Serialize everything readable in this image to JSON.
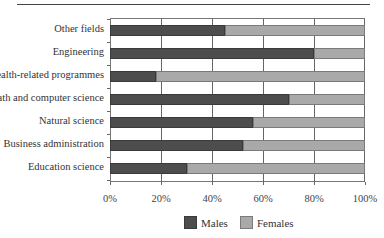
{
  "chart_data": {
    "type": "bar",
    "orientation": "horizontal",
    "stacked": "percent",
    "title": "",
    "xlabel": "",
    "ylabel": "",
    "categories": [
      "Other fields",
      "Engineering",
      "Health-related programmes",
      "Math and computer science",
      "Natural science",
      "Business administration",
      "Education science"
    ],
    "series": [
      {
        "name": "Males",
        "color": "#4d4d4d",
        "values": [
          45,
          80,
          18,
          70,
          56,
          52,
          30
        ]
      },
      {
        "name": "Females",
        "color": "#a9a9a9",
        "values": [
          55,
          20,
          82,
          30,
          44,
          48,
          70
        ]
      }
    ],
    "xlim": [
      0,
      100
    ],
    "x_ticks": [
      "0%",
      "20%",
      "40%",
      "60%",
      "80%",
      "100%"
    ],
    "grid": {
      "vertical": true,
      "horizontal": false
    },
    "legend": {
      "position": "bottom",
      "entries": [
        "Males",
        "Females"
      ]
    }
  },
  "legend": {
    "males_label": "Males",
    "females_label": "Females"
  }
}
